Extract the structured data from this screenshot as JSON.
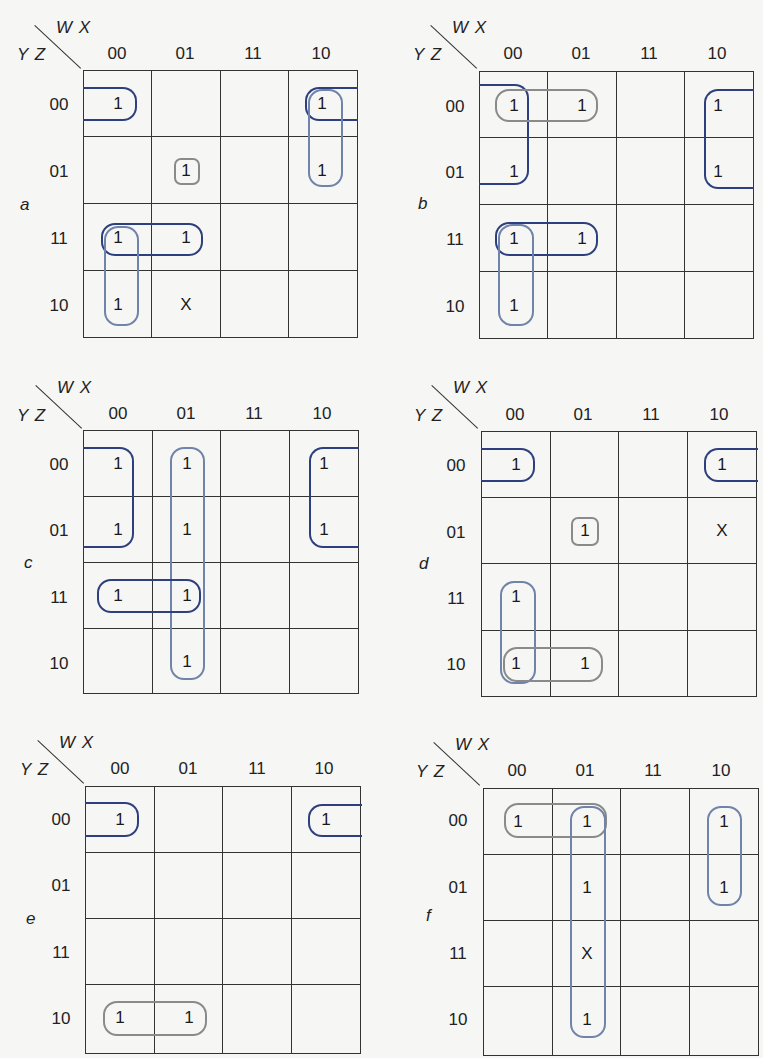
{
  "axis": {
    "col_var": "W X",
    "row_var": "Y Z"
  },
  "col_labels": [
    "00",
    "01",
    "11",
    "10"
  ],
  "row_labels": [
    "00",
    "01",
    "11",
    "10"
  ],
  "colors": {
    "dark_loop": "#2e3f7e",
    "light_loop": "#7083aa",
    "gray_loop": "#8a8a8a",
    "grid": "#333333",
    "background": "#f6f6f4"
  },
  "maps": [
    {
      "letter": "a",
      "cells": [
        [
          "1",
          "",
          "",
          "1"
        ],
        [
          "",
          "1",
          "",
          "1"
        ],
        [
          "1",
          "1",
          "",
          ""
        ],
        [
          "1",
          "X",
          "",
          ""
        ]
      ],
      "loops": [
        {
          "style": "dark",
          "desc": "row 00 wrap: (00,00)+(00,10)"
        },
        {
          "style": "light",
          "desc": "col 10: rows 00-01"
        },
        {
          "style": "gray",
          "desc": "single (01,01)"
        },
        {
          "style": "dark",
          "desc": "row 11: cols 00-01"
        },
        {
          "style": "light",
          "desc": "col 00: rows 11-10"
        }
      ]
    },
    {
      "letter": "b",
      "cells": [
        [
          "1",
          "1",
          "",
          "1"
        ],
        [
          "1",
          "",
          "",
          "1"
        ],
        [
          "1",
          "1",
          "",
          ""
        ],
        [
          "1",
          "",
          "",
          ""
        ]
      ],
      "loops": [
        {
          "style": "dark",
          "desc": "wrap quad rows 00-01 cols 00+10"
        },
        {
          "style": "gray",
          "desc": "row 00: cols 00-01"
        },
        {
          "style": "dark",
          "desc": "row 11: cols 00-01"
        },
        {
          "style": "light",
          "desc": "col 00: rows 11-10"
        }
      ]
    },
    {
      "letter": "c",
      "cells": [
        [
          "1",
          "1",
          "",
          "1"
        ],
        [
          "1",
          "1",
          "",
          "1"
        ],
        [
          "1",
          "1",
          "",
          ""
        ],
        [
          "",
          "1",
          "",
          ""
        ]
      ],
      "loops": [
        {
          "style": "dark",
          "desc": "wrap quad rows 00-01 cols 00+10"
        },
        {
          "style": "light",
          "desc": "col 01 full"
        },
        {
          "style": "dark",
          "desc": "row 11: cols 00-01"
        }
      ]
    },
    {
      "letter": "d",
      "cells": [
        [
          "1",
          "",
          "",
          "1"
        ],
        [
          "",
          "1",
          "",
          "X"
        ],
        [
          "1",
          "",
          "",
          ""
        ],
        [
          "1",
          "1",
          "",
          ""
        ]
      ],
      "loops": [
        {
          "style": "dark",
          "desc": "row 00 wrap: (00,00)+(00,10)"
        },
        {
          "style": "gray",
          "desc": "single (01,01)"
        },
        {
          "style": "light",
          "desc": "col 00: rows 11-10"
        },
        {
          "style": "gray",
          "desc": "row 10: cols 00-01"
        }
      ]
    },
    {
      "letter": "e",
      "cells": [
        [
          "1",
          "",
          "",
          "1"
        ],
        [
          "",
          "",
          "",
          ""
        ],
        [
          "",
          "",
          "",
          ""
        ],
        [
          "1",
          "1",
          "",
          ""
        ]
      ],
      "loops": [
        {
          "style": "dark",
          "desc": "row 00 wrap: (00,00)+(00,10)"
        },
        {
          "style": "gray",
          "desc": "row 10: cols 00-01"
        }
      ]
    },
    {
      "letter": "f",
      "cells": [
        [
          "1",
          "1",
          "",
          "1"
        ],
        [
          "",
          "1",
          "",
          "1"
        ],
        [
          "",
          "X",
          "",
          ""
        ],
        [
          "",
          "1",
          "",
          ""
        ]
      ],
      "loops": [
        {
          "style": "gray",
          "desc": "row 00: cols 00-01"
        },
        {
          "style": "light",
          "desc": "col 01 full"
        },
        {
          "style": "light",
          "desc": "col 10: rows 00-01"
        }
      ]
    }
  ]
}
